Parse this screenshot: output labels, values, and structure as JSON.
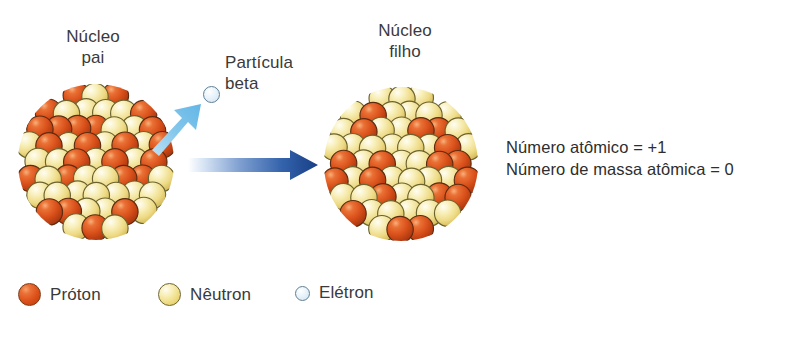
{
  "figure": {
    "title_text": "Decaimento beta",
    "width": 798,
    "height": 349
  },
  "labels": {
    "parent_nucleus": "Núcleo\npai",
    "beta_particle": "Partícula\nbeta",
    "daughter_nucleus": "Núcleo\nfilho"
  },
  "annotations": {
    "atomic_number": "Número atômico = +1",
    "mass_number": "Número de massa atômica = 0"
  },
  "legend": {
    "items": [
      {
        "label": "Próton",
        "icon": "proton-sphere-icon",
        "color": "#dc4f18"
      },
      {
        "label": "Nêutron",
        "icon": "neutron-sphere-icon",
        "color": "#ecd878"
      },
      {
        "label": "Elétron",
        "icon": "electron-circle-icon",
        "color": "#cfe3f1"
      }
    ]
  },
  "arrows": {
    "emission_arrow": {
      "icon": "emission-arrow-icon",
      "color": "#7ec4ec",
      "direction": "up-right"
    },
    "transformation_arrow": {
      "icon": "transformation-arrow-icon",
      "color": "#1c4d96",
      "direction": "right"
    }
  },
  "particles": {
    "emitted_electron": {
      "icon": "electron-circle-icon",
      "color": "#cfe3f1"
    }
  },
  "nuclei": {
    "parent": {
      "name": "parent-nucleus",
      "proton_color": "#dc4f18",
      "neutron_color": "#ecd878"
    },
    "daughter": {
      "name": "daughter-nucleus",
      "proton_color": "#dc4f18",
      "neutron_color": "#ecd878"
    }
  },
  "chart_data": {
    "type": "diagram",
    "nodes": [
      {
        "id": "parent-nucleus",
        "label": "Núcleo pai"
      },
      {
        "id": "beta-particle",
        "label": "Partícula beta"
      },
      {
        "id": "daughter-nucleus",
        "label": "Núcleo filho"
      }
    ],
    "edges": [
      {
        "from": "parent-nucleus",
        "to": "beta-particle",
        "style": "light-blue-arrow"
      },
      {
        "from": "parent-nucleus",
        "to": "daughter-nucleus",
        "style": "blue-gradient-arrow"
      }
    ],
    "annotations": [
      "Número atômico = +1",
      "Número de massa atômica = 0"
    ],
    "legend": [
      "Próton",
      "Nêutron",
      "Elétron"
    ]
  }
}
